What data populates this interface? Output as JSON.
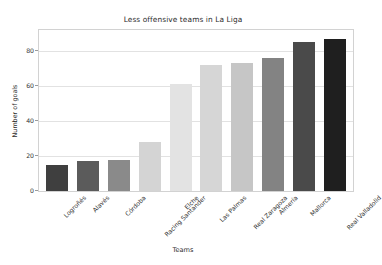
{
  "chart_data": {
    "type": "bar",
    "title": "Less offensive teams in La Liga",
    "xlabel": "Teams",
    "ylabel": "Number of goals",
    "categories": [
      "Logroñés",
      "Alavés",
      "Córdoba",
      "Racing Santander",
      "Elche",
      "Las Palmas",
      "Real Zaragoza",
      "Almería",
      "Mallorca",
      "Real Valladolid"
    ],
    "values": [
      15,
      17,
      18,
      28,
      61,
      72,
      73,
      76,
      85,
      87
    ],
    "bar_colors": [
      "#3f3f3f",
      "#5b5b5b",
      "#8a8a8a",
      "#d4d4d4",
      "#e3e3e3",
      "#d6d6d6",
      "#c6c6c6",
      "#838383",
      "#4a4a4a",
      "#1f1f1f"
    ],
    "ylim": [
      0,
      92
    ],
    "yticks": [
      0,
      20,
      40,
      60,
      80
    ],
    "ytick_labels": [
      "0",
      "20",
      "40",
      "60",
      "80"
    ],
    "grid": true,
    "legend": null
  }
}
